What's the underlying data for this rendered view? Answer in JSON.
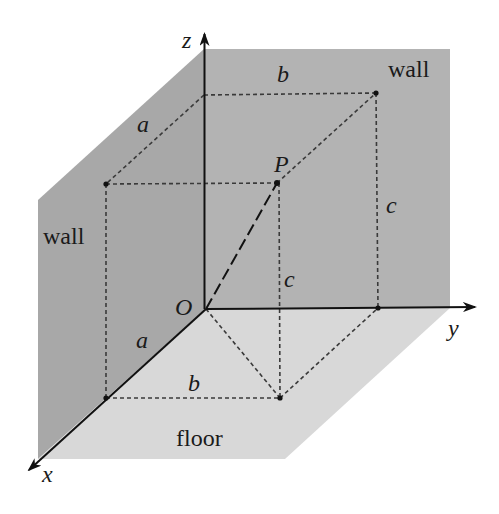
{
  "diagram": {
    "type": "3d-coordinate-box-in-room-corner",
    "colors": {
      "back_wall": "#b3b3b3",
      "left_wall": "#a8a8a8",
      "floor": "#d8d8d8",
      "lines": "#111111",
      "dashed": "#3a3a3a"
    },
    "axes": {
      "x_label": "x",
      "y_label": "y",
      "z_label": "z",
      "origin_label": "O"
    },
    "point": {
      "label": "P"
    },
    "edge_labels": {
      "top_a": "a",
      "top_b": "b",
      "right_c": "c",
      "center_c": "c",
      "floor_a": "a",
      "floor_b": "b"
    },
    "surface_labels": {
      "left_wall": "wall",
      "right_wall": "wall",
      "floor": "floor"
    }
  }
}
